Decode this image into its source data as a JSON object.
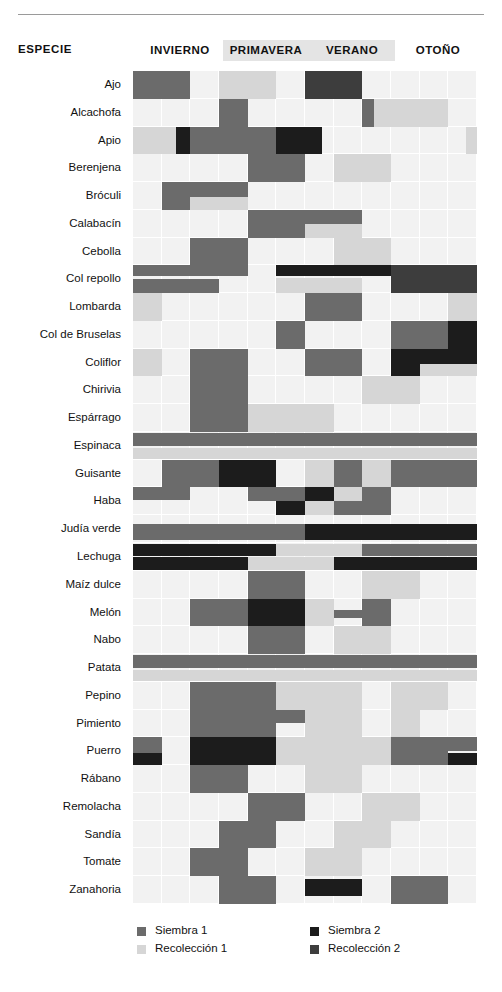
{
  "header": {
    "especie_label": "ESPECIE",
    "seasons": [
      {
        "label": "INVIERNO",
        "band": false,
        "left": 137,
        "width": 86
      },
      {
        "label": "PRIMAVERA",
        "band": true,
        "left": 223,
        "width": 86
      },
      {
        "label": "VERANO",
        "band": true,
        "left": 309,
        "width": 86
      },
      {
        "label": "OTOÑO",
        "band": false,
        "left": 395,
        "width": 86
      }
    ]
  },
  "legend": {
    "items": [
      {
        "label": "Siembra 1",
        "color": "#6b6b6b",
        "left": 137,
        "top": 2
      },
      {
        "label": "Recolección 1",
        "color": "#d6d6d6",
        "left": 137,
        "top": 20
      },
      {
        "label": "Siembra 2",
        "color": "#1c1c1c",
        "left": 310,
        "top": 2
      },
      {
        "label": "Recolección 2",
        "color": "#3d3d3d",
        "left": 310,
        "top": 20
      }
    ]
  },
  "colors": {
    "empty": "#f2f2f2",
    "siembra1": "#6b6b6b",
    "recoleccion1": "#d6d6d6",
    "siembra2": "#1c1c1c",
    "recoleccion2": "#3d3d3d",
    "grid_line": "#ffffff",
    "band": "#e4e4e4"
  },
  "chart_data": {
    "type": "heatmap",
    "title": "",
    "xlabel": "",
    "ylabel": "ESPECIE",
    "grid": true,
    "legend_position": "bottom",
    "months": 12,
    "categories": [
      "Siembra 1",
      "Recolección 1",
      "Siembra 2",
      "Recolección 2"
    ],
    "season_spans": [
      {
        "name": "INVIERNO",
        "start_col": 0,
        "end_col": 2
      },
      {
        "name": "PRIMAVERA",
        "start_col": 3,
        "end_col": 5
      },
      {
        "name": "VERANO",
        "start_col": 6,
        "end_col": 8
      },
      {
        "name": "OTOÑO",
        "start_col": 9,
        "end_col": 11
      }
    ],
    "rows": [
      {
        "species": "Ajo",
        "marks": [
          {
            "cat": "siembra1",
            "c0": 0,
            "c1": 2,
            "t": 0.0,
            "h": 1.0
          },
          {
            "cat": "recoleccion1",
            "c0": 3,
            "c1": 5,
            "t": 0.0,
            "h": 1.0
          },
          {
            "cat": "recoleccion2",
            "c0": 6,
            "c1": 8,
            "t": 0.0,
            "h": 1.0
          }
        ]
      },
      {
        "species": "Alcachofa",
        "marks": [
          {
            "cat": "siembra1",
            "c0": 3,
            "c1": 4,
            "t": 0.0,
            "h": 1.0
          },
          {
            "cat": "siembra1",
            "c0": 8,
            "c1": 8.4,
            "t": 0.0,
            "h": 1.0
          },
          {
            "cat": "recoleccion1",
            "c0": 8.4,
            "c1": 11,
            "t": 0.0,
            "h": 1.0
          }
        ]
      },
      {
        "species": "Apio",
        "marks": [
          {
            "cat": "recoleccion1",
            "c0": 0,
            "c1": 1.5,
            "t": 0.0,
            "h": 1.0
          },
          {
            "cat": "siembra2",
            "c0": 1.5,
            "c1": 2,
            "t": 0.0,
            "h": 1.0
          },
          {
            "cat": "siembra1",
            "c0": 2,
            "c1": 5,
            "t": 0.0,
            "h": 1.0
          },
          {
            "cat": "siembra2",
            "c0": 5,
            "c1": 6.6,
            "t": 0.0,
            "h": 1.0
          },
          {
            "cat": "recoleccion1",
            "c0": 11.6,
            "c1": 12,
            "t": 0.0,
            "h": 1.0
          }
        ]
      },
      {
        "species": "Berenjena",
        "marks": [
          {
            "cat": "siembra1",
            "c0": 4,
            "c1": 6,
            "t": 0.0,
            "h": 1.0
          },
          {
            "cat": "recoleccion1",
            "c0": 7,
            "c1": 9,
            "t": 0.0,
            "h": 1.0
          }
        ]
      },
      {
        "species": "Bróculi",
        "marks": [
          {
            "cat": "siembra1",
            "c0": 1,
            "c1": 2,
            "t": 0.0,
            "h": 1.0
          },
          {
            "cat": "siembra1",
            "c0": 2,
            "c1": 4,
            "t": 0.0,
            "h": 0.52
          },
          {
            "cat": "recoleccion1",
            "c0": 2,
            "c1": 4,
            "t": 0.52,
            "h": 0.48
          }
        ]
      },
      {
        "species": "Calabacín",
        "marks": [
          {
            "cat": "siembra1",
            "c0": 4,
            "c1": 6,
            "t": 0.0,
            "h": 1.0
          },
          {
            "cat": "siembra1",
            "c0": 6,
            "c1": 8,
            "t": 0.0,
            "h": 0.52
          },
          {
            "cat": "recoleccion1",
            "c0": 6,
            "c1": 8,
            "t": 0.52,
            "h": 0.48
          }
        ]
      },
      {
        "species": "Cebolla",
        "marks": [
          {
            "cat": "siembra1",
            "c0": 2,
            "c1": 4,
            "t": 0.0,
            "h": 1.0
          },
          {
            "cat": "recoleccion1",
            "c0": 7,
            "c1": 9,
            "t": 0.0,
            "h": 1.0
          }
        ]
      },
      {
        "species": "Col repollo",
        "marks": [
          {
            "cat": "siembra1",
            "c0": 0,
            "c1": 4,
            "t": 0.0,
            "h": 0.4
          },
          {
            "cat": "siembra1",
            "c0": 0,
            "c1": 3,
            "t": 0.48,
            "h": 0.52
          },
          {
            "cat": "siembra2",
            "c0": 5,
            "c1": 11,
            "t": 0.0,
            "h": 0.4
          },
          {
            "cat": "recoleccion1",
            "c0": 5,
            "c1": 8,
            "t": 0.44,
            "h": 0.56
          },
          {
            "cat": "recoleccion2",
            "c0": 9,
            "c1": 12,
            "t": 0.0,
            "h": 1.0
          }
        ]
      },
      {
        "species": "Lombarda",
        "marks": [
          {
            "cat": "recoleccion1",
            "c0": 0,
            "c1": 1,
            "t": 0.0,
            "h": 1.0
          },
          {
            "cat": "siembra1",
            "c0": 6,
            "c1": 8,
            "t": 0.0,
            "h": 1.0
          },
          {
            "cat": "recoleccion1",
            "c0": 11,
            "c1": 12,
            "t": 0.0,
            "h": 1.0
          }
        ]
      },
      {
        "species": "Col de Bruselas",
        "marks": [
          {
            "cat": "siembra1",
            "c0": 5,
            "c1": 6,
            "t": 0.0,
            "h": 1.0
          },
          {
            "cat": "siembra1",
            "c0": 9,
            "c1": 11,
            "t": 0.0,
            "h": 1.0
          },
          {
            "cat": "siembra2",
            "c0": 11,
            "c1": 12,
            "t": 0.0,
            "h": 1.0
          }
        ]
      },
      {
        "species": "Coliflor",
        "marks": [
          {
            "cat": "recoleccion1",
            "c0": 0,
            "c1": 1,
            "t": 0.0,
            "h": 1.0
          },
          {
            "cat": "siembra1",
            "c0": 2,
            "c1": 4,
            "t": 0.0,
            "h": 1.0
          },
          {
            "cat": "siembra1",
            "c0": 6,
            "c1": 8,
            "t": 0.0,
            "h": 1.0
          },
          {
            "cat": "siembra2",
            "c0": 9,
            "c1": 10,
            "t": 0.0,
            "h": 1.0
          },
          {
            "cat": "siembra2",
            "c0": 10,
            "c1": 12,
            "t": 0.0,
            "h": 0.55
          },
          {
            "cat": "recoleccion1",
            "c0": 10,
            "c1": 12,
            "t": 0.55,
            "h": 0.45
          }
        ]
      },
      {
        "species": "Chirivia",
        "marks": [
          {
            "cat": "siembra1",
            "c0": 2,
            "c1": 4,
            "t": 0.0,
            "h": 1.0
          },
          {
            "cat": "recoleccion1",
            "c0": 8,
            "c1": 10,
            "t": 0.0,
            "h": 1.0
          }
        ]
      },
      {
        "species": "Espárrago",
        "marks": [
          {
            "cat": "siembra1",
            "c0": 2,
            "c1": 4,
            "t": 0.0,
            "h": 1.0
          },
          {
            "cat": "recoleccion1",
            "c0": 4,
            "c1": 7,
            "t": 0.0,
            "h": 1.0
          }
        ]
      },
      {
        "species": "Espinaca",
        "marks": [
          {
            "cat": "siembra1",
            "c0": 0,
            "c1": 12,
            "t": 0.02,
            "h": 0.48
          },
          {
            "cat": "recoleccion1",
            "c0": 0,
            "c1": 12,
            "t": 0.56,
            "h": 0.42
          }
        ]
      },
      {
        "species": "Guisante",
        "marks": [
          {
            "cat": "siembra1",
            "c0": 1,
            "c1": 3,
            "t": 0.0,
            "h": 1.0
          },
          {
            "cat": "siembra2",
            "c0": 3,
            "c1": 5,
            "t": 0.0,
            "h": 1.0
          },
          {
            "cat": "recoleccion1",
            "c0": 6,
            "c1": 7,
            "t": 0.0,
            "h": 1.0
          },
          {
            "cat": "siembra1",
            "c0": 7,
            "c1": 8,
            "t": 0.0,
            "h": 1.0
          },
          {
            "cat": "recoleccion1",
            "c0": 8,
            "c1": 9,
            "t": 0.0,
            "h": 1.0
          },
          {
            "cat": "siembra1",
            "c0": 9,
            "c1": 12,
            "t": 0.0,
            "h": 1.0
          }
        ]
      },
      {
        "species": "Haba",
        "marks": [
          {
            "cat": "siembra1",
            "c0": 0,
            "c1": 2,
            "t": 0.0,
            "h": 0.45
          },
          {
            "cat": "siembra1",
            "c0": 4,
            "c1": 6,
            "t": 0.0,
            "h": 0.5
          },
          {
            "cat": "siembra2",
            "c0": 5,
            "c1": 6,
            "t": 0.5,
            "h": 0.5
          },
          {
            "cat": "siembra2",
            "c0": 6,
            "c1": 7,
            "t": 0.0,
            "h": 0.5
          },
          {
            "cat": "recoleccion1",
            "c0": 6,
            "c1": 7,
            "t": 0.5,
            "h": 0.5
          },
          {
            "cat": "recoleccion1",
            "c0": 7,
            "c1": 8,
            "t": 0.0,
            "h": 0.5
          },
          {
            "cat": "siembra1",
            "c0": 7,
            "c1": 8,
            "t": 0.5,
            "h": 0.5
          },
          {
            "cat": "siembra1",
            "c0": 8,
            "c1": 9,
            "t": 0.0,
            "h": 1.0
          }
        ]
      },
      {
        "species": "Judía verde",
        "marks": [
          {
            "cat": "siembra1",
            "c0": 0,
            "c1": 6,
            "t": 0.3,
            "h": 0.6
          },
          {
            "cat": "siembra2",
            "c0": 6,
            "c1": 12,
            "t": 0.3,
            "h": 0.6
          }
        ]
      },
      {
        "species": "Lechuga",
        "marks": [
          {
            "cat": "siembra2",
            "c0": 0,
            "c1": 5,
            "t": 0.05,
            "h": 0.42
          },
          {
            "cat": "recoleccion1",
            "c0": 5,
            "c1": 8,
            "t": 0.05,
            "h": 0.42
          },
          {
            "cat": "siembra1",
            "c0": 8,
            "c1": 12,
            "t": 0.05,
            "h": 0.42
          },
          {
            "cat": "siembra2",
            "c0": 0,
            "c1": 4,
            "t": 0.52,
            "h": 0.44
          },
          {
            "cat": "recoleccion1",
            "c0": 4,
            "c1": 7,
            "t": 0.52,
            "h": 0.44
          },
          {
            "cat": "siembra2",
            "c0": 7,
            "c1": 12,
            "t": 0.52,
            "h": 0.44
          }
        ]
      },
      {
        "species": "Maíz dulce",
        "marks": [
          {
            "cat": "siembra1",
            "c0": 4,
            "c1": 6,
            "t": 0.0,
            "h": 1.0
          },
          {
            "cat": "recoleccion1",
            "c0": 8,
            "c1": 10,
            "t": 0.0,
            "h": 1.0
          }
        ]
      },
      {
        "species": "Melón",
        "marks": [
          {
            "cat": "siembra1",
            "c0": 2,
            "c1": 4,
            "t": 0.0,
            "h": 1.0
          },
          {
            "cat": "siembra2",
            "c0": 4,
            "c1": 6,
            "t": 0.0,
            "h": 1.0
          },
          {
            "cat": "recoleccion1",
            "c0": 6,
            "c1": 7,
            "t": 0.0,
            "h": 1.0
          },
          {
            "cat": "siembra1",
            "c0": 7,
            "c1": 8,
            "t": 0.4,
            "h": 0.3
          },
          {
            "cat": "siembra1",
            "c0": 8,
            "c1": 9,
            "t": 0.0,
            "h": 1.0
          }
        ]
      },
      {
        "species": "Nabo",
        "marks": [
          {
            "cat": "siembra1",
            "c0": 4,
            "c1": 6,
            "t": 0.0,
            "h": 1.0
          },
          {
            "cat": "recoleccion1",
            "c0": 7,
            "c1": 9,
            "t": 0.0,
            "h": 1.0
          }
        ]
      },
      {
        "species": "Patata",
        "marks": [
          {
            "cat": "siembra1",
            "c0": 0,
            "c1": 12,
            "t": 0.04,
            "h": 0.46
          },
          {
            "cat": "recoleccion1",
            "c0": 0,
            "c1": 12,
            "t": 0.56,
            "h": 0.4
          }
        ]
      },
      {
        "species": "Pepino",
        "marks": [
          {
            "cat": "siembra1",
            "c0": 2,
            "c1": 5,
            "t": 0.0,
            "h": 1.0
          },
          {
            "cat": "recoleccion1",
            "c0": 5,
            "c1": 8,
            "t": 0.0,
            "h": 1.0
          },
          {
            "cat": "recoleccion1",
            "c0": 9,
            "c1": 11,
            "t": 0.0,
            "h": 1.0
          }
        ]
      },
      {
        "species": "Pimiento",
        "marks": [
          {
            "cat": "siembra1",
            "c0": 2,
            "c1": 5,
            "t": 0.0,
            "h": 1.0
          },
          {
            "cat": "siembra1",
            "c0": 5,
            "c1": 6,
            "t": 0.0,
            "h": 0.5
          },
          {
            "cat": "recoleccion1",
            "c0": 6,
            "c1": 8,
            "t": 0.0,
            "h": 1.0
          },
          {
            "cat": "recoleccion1",
            "c0": 9,
            "c1": 10,
            "t": 0.0,
            "h": 1.0
          }
        ]
      },
      {
        "species": "Puerro",
        "marks": [
          {
            "cat": "siembra1",
            "c0": 0,
            "c1": 1,
            "t": 0.0,
            "h": 0.55
          },
          {
            "cat": "siembra2",
            "c0": 0,
            "c1": 1,
            "t": 0.55,
            "h": 0.45
          },
          {
            "cat": "siembra2",
            "c0": 2,
            "c1": 5,
            "t": 0.0,
            "h": 1.0
          },
          {
            "cat": "recoleccion1",
            "c0": 5,
            "c1": 9,
            "t": 0.0,
            "h": 1.0
          },
          {
            "cat": "siembra1",
            "c0": 9,
            "c1": 11,
            "t": 0.0,
            "h": 1.0
          },
          {
            "cat": "siembra1",
            "c0": 11,
            "c1": 12,
            "t": 0.0,
            "h": 0.5
          },
          {
            "cat": "siembra2",
            "c0": 11,
            "c1": 12,
            "t": 0.55,
            "h": 0.45
          }
        ]
      },
      {
        "species": "Rábano",
        "marks": [
          {
            "cat": "siembra1",
            "c0": 2,
            "c1": 4,
            "t": 0.0,
            "h": 1.0
          },
          {
            "cat": "recoleccion1",
            "c0": 6,
            "c1": 8,
            "t": 0.0,
            "h": 1.0
          }
        ]
      },
      {
        "species": "Remolacha",
        "marks": [
          {
            "cat": "siembra1",
            "c0": 4,
            "c1": 6,
            "t": 0.0,
            "h": 1.0
          },
          {
            "cat": "recoleccion1",
            "c0": 8,
            "c1": 10,
            "t": 0.0,
            "h": 1.0
          }
        ]
      },
      {
        "species": "Sandía",
        "marks": [
          {
            "cat": "siembra1",
            "c0": 3,
            "c1": 5,
            "t": 0.0,
            "h": 1.0
          },
          {
            "cat": "recoleccion1",
            "c0": 7,
            "c1": 9,
            "t": 0.0,
            "h": 1.0
          }
        ]
      },
      {
        "species": "Tomate",
        "marks": [
          {
            "cat": "siembra1",
            "c0": 2,
            "c1": 4,
            "t": 0.0,
            "h": 1.0
          },
          {
            "cat": "recoleccion1",
            "c0": 6,
            "c1": 8,
            "t": 0.0,
            "h": 1.0
          }
        ]
      },
      {
        "species": "Zanahoria",
        "marks": [
          {
            "cat": "siembra1",
            "c0": 3,
            "c1": 5,
            "t": 0.0,
            "h": 1.0
          },
          {
            "cat": "siembra2",
            "c0": 6,
            "c1": 8,
            "t": 0.1,
            "h": 0.62
          },
          {
            "cat": "siembra1",
            "c0": 9,
            "c1": 11,
            "t": 0.0,
            "h": 1.0
          }
        ]
      }
    ]
  }
}
